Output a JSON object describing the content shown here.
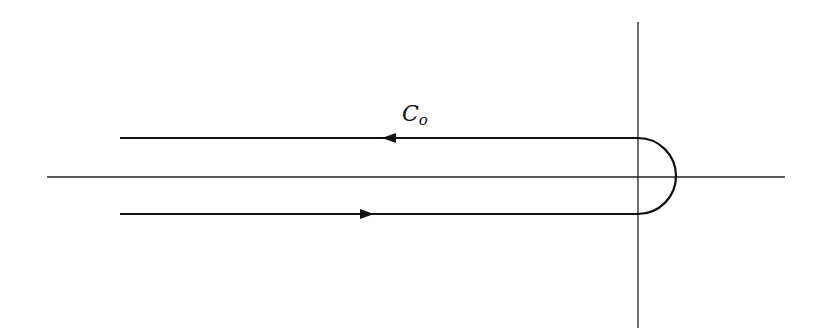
{
  "diagram": {
    "type": "hankel-contour",
    "contour_label": {
      "main": "C",
      "subscript": "o"
    },
    "colors": {
      "stroke": "#111111",
      "axis": "#222222",
      "background": "#ffffff"
    },
    "axes": {
      "horizontal": {
        "x1": 47,
        "y": 177,
        "x2": 785
      },
      "vertical": {
        "x": 638,
        "y1": 22,
        "y2": 328
      }
    },
    "contour": {
      "upper_line": {
        "x_start": 120,
        "x_end": 638,
        "y": 138,
        "direction": "left"
      },
      "lower_line": {
        "x_start": 120,
        "x_end": 638,
        "y": 214,
        "direction": "right"
      },
      "semicircle": {
        "cx": 638,
        "cy": 176,
        "r": 38,
        "side": "right"
      },
      "arrows": [
        {
          "x": 382,
          "y": 138,
          "points": "left"
        },
        {
          "x": 372,
          "y": 214,
          "points": "right"
        }
      ]
    }
  }
}
